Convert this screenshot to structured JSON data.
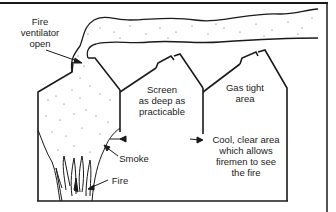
{
  "diagram": {
    "colors": {
      "line": "#1a1a1a",
      "background": "#ffffff",
      "smoke_dot": "#555555"
    },
    "labels": {
      "fire_ventilator": [
        "Fire",
        "ventilator",
        "open"
      ],
      "screen": [
        "Screen",
        "as deep as",
        "practicable"
      ],
      "gas_tight": [
        "Gas tight",
        "area"
      ],
      "cool_area": [
        "Cool, clear area",
        "which allows",
        "firemen to see",
        "the fire"
      ],
      "smoke": "Smoke",
      "fire": "Fire"
    }
  }
}
